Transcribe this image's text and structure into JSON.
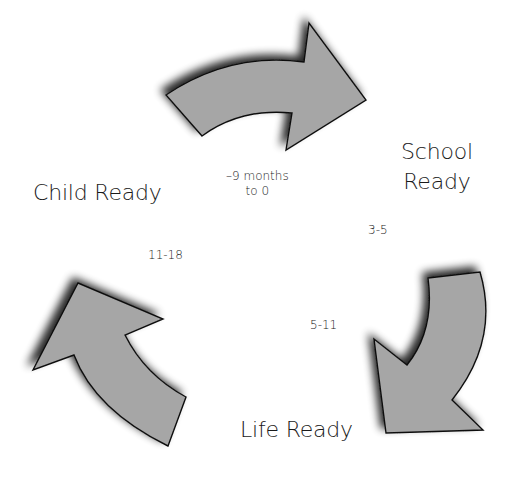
{
  "diagram": {
    "type": "cycle",
    "colors": {
      "arrow_fill": "#a6a6a6",
      "arrow_stroke": "#111111",
      "text": "#1a1a1a",
      "background": "#ffffff"
    },
    "stages": [
      {
        "id": "child",
        "label": "Child Ready"
      },
      {
        "id": "school",
        "label_line1": "School",
        "label_line2": "Ready"
      },
      {
        "id": "life",
        "label": "Life Ready"
      }
    ],
    "age_ranges": {
      "prenatal_line1": "–9 months",
      "prenatal_line2": "to 0",
      "early": "3-5",
      "middle": "5-11",
      "teen": "11-18"
    },
    "arrows": [
      {
        "id": "top",
        "direction": "clockwise",
        "from": "Child Ready",
        "to": "School Ready"
      },
      {
        "id": "right",
        "direction": "clockwise",
        "from": "School Ready",
        "to": "Life Ready"
      },
      {
        "id": "left",
        "direction": "clockwise",
        "from": "Life Ready",
        "to": "Child Ready"
      }
    ]
  }
}
